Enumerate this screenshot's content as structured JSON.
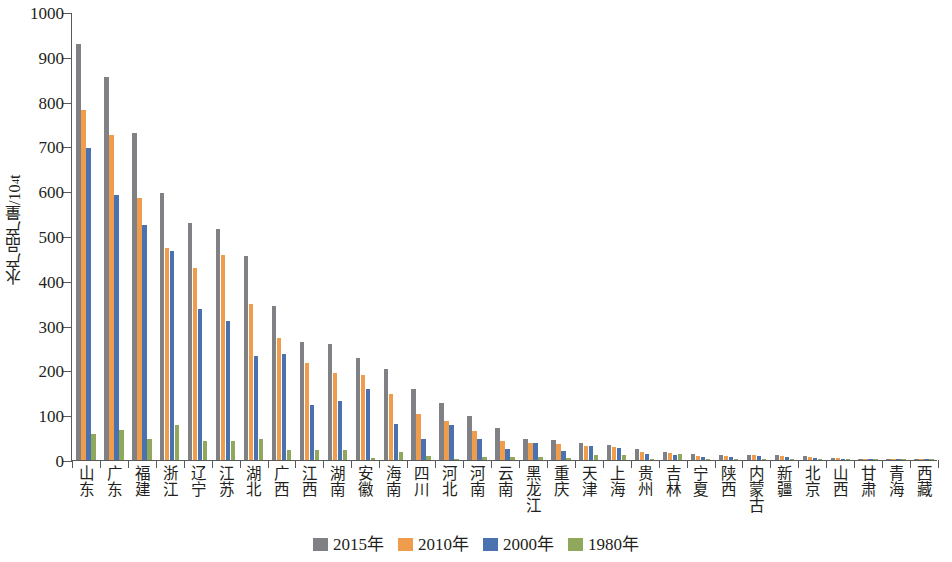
{
  "chart_data": {
    "type": "bar",
    "title": "",
    "xlabel": "",
    "ylabel": "水产品产量/10⁴t",
    "ylabel_base": "水产品产量/10",
    "ylabel_sup": "4",
    "ylabel_unit": "t",
    "ylim": [
      0,
      1000
    ],
    "ytick_step": 100,
    "yticks": [
      0,
      100,
      200,
      300,
      400,
      500,
      600,
      700,
      800,
      900,
      1000
    ],
    "grid": false,
    "legend_position": "bottom-center",
    "categories": [
      "山东",
      "广东",
      "福建",
      "浙江",
      "辽宁",
      "江苏",
      "湖北",
      "广西",
      "江西",
      "湖南",
      "安徽",
      "海南",
      "四川",
      "河北",
      "河南",
      "云南",
      "黑龙江",
      "重庆",
      "天津",
      "上海",
      "贵州",
      "吉林",
      "宁夏",
      "陕西",
      "内蒙古",
      "新疆",
      "北京",
      "山西",
      "甘肃",
      "青海",
      "西藏"
    ],
    "series": [
      {
        "name": "2015年",
        "color": "#808184",
        "values": [
          928,
          856,
          731,
          595,
          528,
          516,
          455,
          344,
          263,
          258,
          227,
          204,
          158,
          128,
          99,
          71,
          46,
          44,
          39,
          34,
          25,
          19,
          13,
          12,
          12,
          11,
          9,
          5,
          3,
          1,
          0.4
        ]
      },
      {
        "name": "2010年",
        "color": "#ef9c4d",
        "values": [
          781,
          726,
          584,
          474,
          429,
          458,
          348,
          273,
          216,
          194,
          190,
          147,
          103,
          88,
          64,
          42,
          38,
          35,
          32,
          30,
          19,
          15,
          9,
          10,
          11,
          9,
          6,
          4,
          2,
          1,
          0.3
        ]
      },
      {
        "name": "2000年",
        "color": "#4a72b0",
        "values": [
          697,
          591,
          524,
          466,
          337,
          310,
          233,
          237,
          122,
          131,
          158,
          80,
          48,
          79,
          47,
          24,
          39,
          20,
          31,
          26,
          13,
          12,
          7,
          6,
          8,
          7,
          5,
          3,
          1,
          0.5,
          0.2
        ]
      },
      {
        "name": "1980年",
        "color": "#8fa85c",
        "values": [
          59,
          66,
          46,
          79,
          42,
          43,
          47,
          22,
          22,
          22,
          5,
          18,
          9,
          3,
          7,
          6,
          6,
          4,
          12,
          11,
          2,
          14,
          0.3,
          0.6,
          2,
          1,
          2,
          0.4,
          0.3,
          0.1,
          0.05
        ]
      }
    ]
  },
  "legend": {
    "items": [
      {
        "label": "2015年",
        "color": "#808184"
      },
      {
        "label": "2010年",
        "color": "#ef9c4d"
      },
      {
        "label": "2000年",
        "color": "#4a72b0"
      },
      {
        "label": "1980年",
        "color": "#8fa85c"
      }
    ]
  }
}
